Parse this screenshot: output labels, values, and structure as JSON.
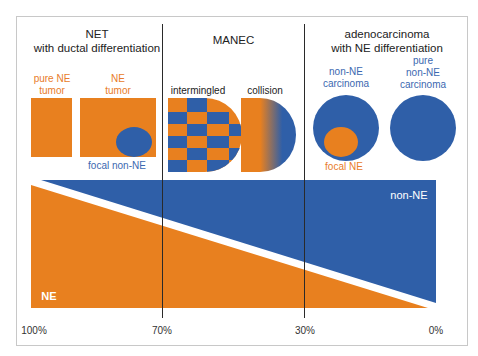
{
  "colors": {
    "ne": "#e8801f",
    "non_ne": "#2f5fa8",
    "divider": "#2a2a2a"
  },
  "sections": {
    "net": {
      "title_line1": "NET",
      "title_line2": "with ductal differentiation",
      "pure_ne_line1": "pure NE",
      "pure_ne_line2": "tumor",
      "ne_tumor_line1": "NE",
      "ne_tumor_line2": "tumor",
      "focal_non_ne": "focal non-NE"
    },
    "manec": {
      "title": "MANEC",
      "intermingled": "intermingled",
      "collision": "collision"
    },
    "adeno": {
      "title_line1": "adenocarcinoma",
      "title_line2": "with NE differentiation",
      "non_ne_line1": "non-NE",
      "non_ne_line2": "carcinoma",
      "pure_line1": "pure",
      "pure_line2": "non-NE",
      "pure_line3": "carcinoma",
      "focal_ne": "focal NE"
    }
  },
  "gradient": {
    "non_ne_label": "non-NE",
    "ne_label": "NE"
  },
  "axis_ticks": [
    "100%",
    "70%",
    "30%",
    "0%"
  ]
}
